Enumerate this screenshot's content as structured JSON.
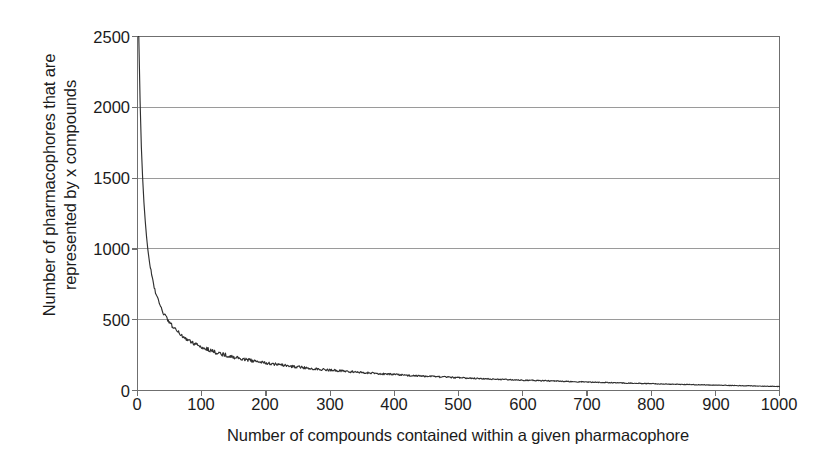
{
  "chart_data": {
    "type": "line",
    "title": "",
    "xlabel": "Number of compounds contained within a given pharmacophore",
    "ylabel": "Number of pharmacophores that are represented by x compounds",
    "ylabel_lines": [
      "Number of pharmacophores that are",
      "represented by x compounds"
    ],
    "xlim": [
      0,
      1000
    ],
    "ylim": [
      0,
      2500
    ],
    "xticks": [
      0,
      100,
      200,
      300,
      400,
      500,
      600,
      700,
      800,
      900,
      1000
    ],
    "yticks": [
      0,
      500,
      1000,
      1500,
      2000,
      2500
    ],
    "grid": "horizontal",
    "legend": "none",
    "line_color": "#303030",
    "grid_color": "#9a9a9a",
    "axis_color": "#6f6f6f",
    "background": "#ffffff",
    "series": [
      {
        "name": "pharmacophore frequency distribution",
        "x": [
          2,
          4,
          6,
          8,
          10,
          12,
          14,
          16,
          18,
          20,
          22,
          24,
          26,
          28,
          30,
          32,
          34,
          36,
          38,
          40,
          42,
          44,
          46,
          48,
          50,
          55,
          60,
          65,
          70,
          75,
          80,
          85,
          90,
          95,
          100,
          110,
          120,
          130,
          140,
          150,
          160,
          170,
          180,
          190,
          200,
          220,
          240,
          260,
          280,
          300,
          320,
          340,
          360,
          380,
          400,
          430,
          460,
          490,
          520,
          550,
          580,
          610,
          640,
          670,
          700,
          740,
          780,
          820,
          860,
          900,
          940,
          970,
          1000
        ],
        "y": [
          2500,
          2050,
          1720,
          1500,
          1330,
          1200,
          1090,
          1000,
          930,
          870,
          815,
          770,
          730,
          695,
          665,
          638,
          613,
          590,
          570,
          552,
          535,
          519,
          505,
          491,
          478,
          450,
          425,
          404,
          385,
          368,
          353,
          340,
          328,
          317,
          307,
          289,
          273,
          259,
          247,
          236,
          226,
          217,
          209,
          201,
          194,
          182,
          171,
          161,
          152,
          144,
          137,
          130,
          124,
          118,
          113,
          105,
          98,
          92,
          86,
          81,
          76,
          72,
          68,
          64,
          60,
          55,
          50,
          46,
          42,
          38,
          34,
          31,
          28
        ]
      }
    ]
  },
  "axes": {
    "y_tick_labels": [
      "2500",
      "2000",
      "1500",
      "1000",
      "500",
      "0"
    ],
    "x_tick_labels": [
      "0",
      "100",
      "200",
      "300",
      "400",
      "500",
      "600",
      "700",
      "800",
      "900",
      "1000"
    ]
  }
}
